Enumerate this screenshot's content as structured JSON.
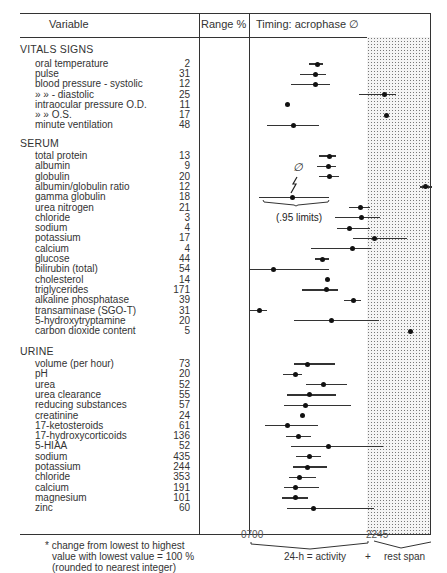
{
  "header": {
    "variable": "Variable",
    "range": "Range %",
    "timing": "Timing: acrophase ∅"
  },
  "sections": [
    {
      "title": "VITALS SIGNS"
    },
    {
      "title": "SERUM"
    },
    {
      "title": "URINE"
    }
  ],
  "rows": [
    {
      "label": "oral temperature",
      "range": "2"
    },
    {
      "label": "pulse",
      "range": "31"
    },
    {
      "label": "blood pressure - systolic",
      "range": "12"
    },
    {
      "label": "»        »       - diastolic",
      "range": "25"
    },
    {
      "label": "intraocular pressure O.D.",
      "range": "11"
    },
    {
      "label": "»              »          O.S.",
      "range": "17"
    },
    {
      "label": "minute ventilation",
      "range": "48"
    },
    {
      "label": "total protein",
      "range": "13"
    },
    {
      "label": "albumin",
      "range": "9"
    },
    {
      "label": "globulin",
      "range": "20"
    },
    {
      "label": "albumin/globulin ratio",
      "range": "12"
    },
    {
      "label": "gamma globulin",
      "range": "18"
    },
    {
      "label": "urea nitrogen",
      "range": "21"
    },
    {
      "label": "chloride",
      "range": "3"
    },
    {
      "label": "sodium",
      "range": "4"
    },
    {
      "label": "potassium",
      "range": "17"
    },
    {
      "label": "calcium",
      "range": "4"
    },
    {
      "label": "glucose",
      "range": "44"
    },
    {
      "label": "bilirubin (total)",
      "range": "54"
    },
    {
      "label": "cholesterol",
      "range": "14"
    },
    {
      "label": "triglycerides",
      "range": "171"
    },
    {
      "label": "alkaline phosphatase",
      "range": "39"
    },
    {
      "label": "transaminase (SGO-T)",
      "range": "31"
    },
    {
      "label": "5-hydroxytryptamine",
      "range": "20"
    },
    {
      "label": "carbon dioxide content",
      "range": "5"
    },
    {
      "label": "volume (per hour)",
      "range": "73"
    },
    {
      "label": "pH",
      "range": "20"
    },
    {
      "label": "urea",
      "range": "52"
    },
    {
      "label": "urea clearance",
      "range": "55"
    },
    {
      "label": "reducing substances",
      "range": "57"
    },
    {
      "label": "creatinine",
      "range": "24"
    },
    {
      "label": "17-ketosteroids",
      "range": "61"
    },
    {
      "label": "17-hydroxycorticoids",
      "range": "136"
    },
    {
      "label": "5-HIAA",
      "range": "52"
    },
    {
      "label": "sodium",
      "range": "435"
    },
    {
      "label": "potassium",
      "range": "244"
    },
    {
      "label": "chloride",
      "range": "353"
    },
    {
      "label": "calcium",
      "range": "191"
    },
    {
      "label": "magnesium",
      "range": "101"
    },
    {
      "label": "zinc",
      "range": "60"
    }
  ],
  "annotation": {
    "symbol": "∅",
    "limits": "(.95 limits)"
  },
  "footnote": {
    "line1": "* change from lowest to highest",
    "line2": "value with lowest value = 100 %",
    "line3": "(rounded to nearest integer)"
  },
  "axis": {
    "start": "0700",
    "mid": "2245",
    "activity": "24-h = activity",
    "plus": "+",
    "rest": "rest span"
  },
  "chart_data": {
    "type": "scatter",
    "title": "Timing: acrophase ∅",
    "xlabel": "24-h = activity + rest span",
    "x_ticks": [
      "0700",
      "2245"
    ],
    "x_range_clock": [
      "07:00",
      "07:00 (+24h)"
    ],
    "shaded_region": {
      "from": "22:45",
      "to": "07:00",
      "label": "rest span"
    },
    "note": "Dots = acrophase estimate; horizontal bars = .95 limits. x values as approximate clock hours (7 = 07:00, 22.75 = 22:45, 31 = 07:00 next day).",
    "categories": [
      "oral temperature",
      "pulse",
      "blood pressure - systolic",
      "blood pressure - diastolic",
      "intraocular pressure O.D.",
      "intraocular pressure O.S.",
      "minute ventilation",
      "total protein",
      "albumin",
      "globulin",
      "albumin/globulin ratio",
      "gamma globulin",
      "urea nitrogen",
      "chloride",
      "sodium",
      "potassium",
      "calcium",
      "glucose",
      "bilirubin (total)",
      "cholesterol",
      "triglycerides",
      "alkaline phosphatase",
      "transaminase (SGO-T)",
      "5-hydroxytryptamine",
      "carbon dioxide content",
      "volume (per hour)",
      "pH",
      "urea",
      "urea clearance",
      "reducing substances",
      "creatinine",
      "17-ketosteroids",
      "17-hydroxycorticoids",
      "5-HIAA",
      "sodium (urine)",
      "potassium (urine)",
      "chloride (urine)",
      "calcium (urine)",
      "magnesium (urine)",
      "zinc"
    ],
    "groups": {
      "VITALS SIGNS": [
        0,
        6
      ],
      "SERUM": [
        7,
        24
      ],
      "URINE": [
        25,
        39
      ]
    },
    "range_percent": [
      2,
      31,
      12,
      25,
      11,
      17,
      48,
      13,
      9,
      20,
      12,
      18,
      21,
      3,
      4,
      17,
      4,
      44,
      54,
      14,
      171,
      39,
      31,
      20,
      5,
      73,
      20,
      52,
      55,
      57,
      24,
      61,
      136,
      52,
      435,
      244,
      353,
      191,
      101,
      60
    ],
    "series": [
      {
        "name": "acrophase_px",
        "values": [
          317,
          315,
          315,
          384,
          287,
          386,
          293,
          329,
          328,
          329,
          425,
          292,
          360,
          361,
          349,
          374,
          352,
          322,
          273,
          327,
          326,
          353,
          259,
          331,
          410,
          307,
          295,
          323,
          309,
          305,
          302,
          287,
          298,
          328,
          309,
          307,
          299,
          295,
          295,
          313
        ]
      },
      {
        "name": "ci_low_px",
        "values": [
          309,
          300,
          291,
          359,
          287,
          386,
          267,
          319,
          317,
          319,
          420,
          259,
          349,
          335,
          337,
          353,
          311,
          315,
          250,
          327,
          302,
          344,
          250,
          294,
          410,
          294,
          283,
          306,
          287,
          284,
          302,
          265,
          286,
          291,
          296,
          293,
          289,
          284,
          282,
          287
        ]
      },
      {
        "name": "ci_high_px",
        "values": [
          323,
          326,
          330,
          396,
          287,
          386,
          319,
          336,
          336,
          339,
          432,
          329,
          370,
          380,
          370,
          407,
          371,
          329,
          329,
          327,
          338,
          361,
          267,
          379,
          410,
          335,
          302,
          347,
          336,
          351,
          302,
          318,
          311,
          383,
          321,
          327,
          316,
          319,
          308,
          374
        ]
      }
    ]
  }
}
